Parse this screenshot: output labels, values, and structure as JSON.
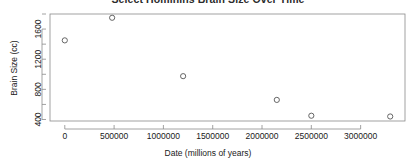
{
  "chart_data": {
    "type": "scatter",
    "title": "Select Hominins Brain Size Over Time",
    "xlabel": "Date (millions of years)",
    "ylabel": "Brain Size (cc)",
    "xlim": [
      -150000,
      3450000
    ],
    "ylim": [
      380,
      1800
    ],
    "grid": false,
    "legend": false,
    "xticks": [
      0,
      500000,
      1000000,
      1500000,
      2000000,
      2500000,
      3000000
    ],
    "xticklabels": [
      "0",
      "500000",
      "1000000",
      "1500000",
      "2000000",
      "2500000",
      "3000000"
    ],
    "yticks": [
      400,
      800,
      1200,
      1600
    ],
    "yticklabels": [
      "400",
      "800",
      "1200",
      "1600"
    ],
    "marker": "open-circle",
    "marker_color": "#555555",
    "points": [
      {
        "x": 0,
        "y": 1450
      },
      {
        "x": 480000,
        "y": 1750
      },
      {
        "x": 1200000,
        "y": 975
      },
      {
        "x": 2150000,
        "y": 660
      },
      {
        "x": 2500000,
        "y": 450
      },
      {
        "x": 3300000,
        "y": 440
      }
    ],
    "x": [
      0,
      480000,
      1200000,
      2150000,
      2500000,
      3300000
    ],
    "values": [
      1450,
      1750,
      975,
      660,
      450,
      440
    ]
  },
  "axes": {
    "frame_color": "#8a8a8a",
    "tick_color": "#8a8a8a"
  }
}
